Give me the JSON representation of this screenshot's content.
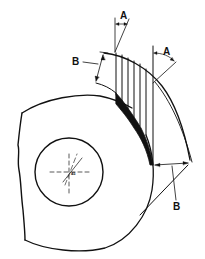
{
  "diagram": {
    "labels": {
      "a_top": "A",
      "a_right": "A",
      "b_left": "B",
      "b_bottom": "B",
      "center_mark": "45"
    },
    "colors": {
      "line": "#111111",
      "background": "#ffffff",
      "fill": "#111111"
    }
  }
}
